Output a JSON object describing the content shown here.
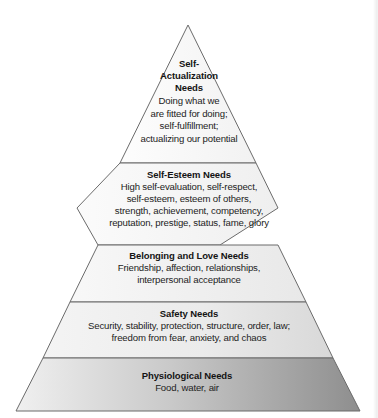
{
  "figure": {
    "name": "maslow-hierarchy-of-needs-pyramid",
    "background_color": "#ffffff",
    "outline_color": "#6b6b6b",
    "heading_color": "#141414",
    "body_color": "#232323"
  },
  "tiers": [
    {
      "id": "self-actualization",
      "heading_lines": [
        "Self-",
        "Actualization",
        "Needs"
      ],
      "body_lines": [
        "Doing what we",
        "are fitted for doing;",
        "self-fulfillment;",
        "actualizing our potential"
      ],
      "fill_start": "#fdfdfd",
      "fill_end": "#f2f2f2"
    },
    {
      "id": "self-esteem",
      "heading_lines": [
        "Self-Esteem Needs"
      ],
      "body_lines": [
        "High self-evaluation, self-respect,",
        "self-esteem, esteem of others,",
        "strength, achievement, competency,",
        "reputation, prestige, status, fame, glory"
      ],
      "fill_start": "#fbfbfb",
      "fill_end": "#efefef"
    },
    {
      "id": "belonging-and-love",
      "heading_lines": [
        "Belonging and Love Needs"
      ],
      "body_lines": [
        "Friendship, affection, relationships,",
        "interpersonal acceptance"
      ],
      "fill_start": "#f8f8f8",
      "fill_end": "#e8e8e8"
    },
    {
      "id": "safety",
      "heading_lines": [
        "Safety Needs"
      ],
      "body_lines": [
        "Security, stability, protection, structure, order, law;",
        "freedom from fear, anxiety, and chaos"
      ],
      "fill_start": "#f4f4f4",
      "fill_end": "#d8d8d8"
    },
    {
      "id": "physiological",
      "heading_lines": [
        "Physiological Needs"
      ],
      "body_lines": [
        "Food, water, air"
      ],
      "fill_start": "#f0f0f0",
      "fill_end": "#8e8e8e"
    }
  ]
}
